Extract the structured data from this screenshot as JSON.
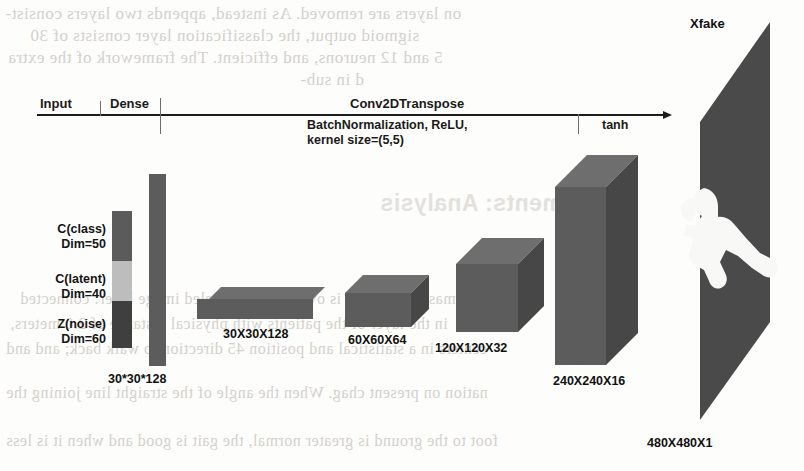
{
  "figure": {
    "kind": "generator-architecture-diagram",
    "output_label": "Xfake"
  },
  "timeline": {
    "stages": [
      {
        "name": "input",
        "label": "Input"
      },
      {
        "name": "dense",
        "label": "Dense"
      },
      {
        "name": "conv",
        "label": "Conv2DTranspose"
      }
    ],
    "annotations": [
      {
        "name": "conv-params",
        "line1": "BatchNormalization, ReLU,",
        "line2": "kernel size=(5,5)"
      },
      {
        "name": "activation",
        "label": "tanh"
      }
    ]
  },
  "input_vector": {
    "segments": [
      {
        "name": "c-class",
        "title": "C(class)",
        "dim": "Dim=50",
        "color": "#5b5b5b"
      },
      {
        "name": "c-latent",
        "title": "C(latent)",
        "dim": "Dim=40",
        "color": "#bdbdbd"
      },
      {
        "name": "z-noise",
        "title": "Z(noise)",
        "dim": "Dim=60",
        "color": "#3f3f3f"
      }
    ]
  },
  "layers": [
    {
      "name": "dense-bar",
      "label": "30*30*128",
      "shape_type": "bar"
    },
    {
      "name": "feature-map-1",
      "label": "30X30X128",
      "shape_type": "box"
    },
    {
      "name": "feature-map-2",
      "label": "60X60X64",
      "shape_type": "box"
    },
    {
      "name": "feature-map-3",
      "label": "120X120X32",
      "shape_type": "box"
    },
    {
      "name": "feature-map-4",
      "label": "240X240X16",
      "shape_type": "box"
    },
    {
      "name": "output-image",
      "label": "480X480X1",
      "shape_type": "panel"
    }
  ],
  "colors": {
    "box_front": "#5c5c5c",
    "box_top": "#6e6e6e",
    "box_side": "#474747",
    "panel": "#4a4a4a",
    "axis": "#1d1d1d",
    "page_bg": "#fdfdfb"
  },
  "bleed_through_text": {
    "note": "mirrored show-through from reverse page of the scan",
    "lines": [
      "on layers are removed. As instead, appends two layers consist-",
      "sigmoid output, the classification layer consists of 30",
      "5 and 12 neurons, and efficient. The framework of the extra",
      "d in sub-",
      "experiments: Analysis",
      "masse this layer is over and use labeled image layer: connected",
      "in the layer of the patients with physical distance of 2.0 meters,",
      "centers in a statistical and position 45 direction to walk back; and and",
      "nation on present chag. When the angle of the straight line joining the",
      "foot to the ground is greater normal, the gait is good and when it is less"
    ]
  }
}
